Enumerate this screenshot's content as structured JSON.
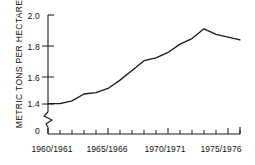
{
  "chart_data": {
    "type": "line",
    "title": "",
    "subtitle": "",
    "xlabel": "",
    "ylabel": "METRIC TONS PER HECTARE",
    "x": [
      "1960/1961",
      "1961/1962",
      "1962/1963",
      "1963/1964",
      "1964/1965",
      "1965/1966",
      "1966/1967",
      "1967/1968",
      "1968/1969",
      "1969/1970",
      "1970/1971",
      "1971/1972",
      "1972/1973",
      "1973/1974",
      "1974/1975",
      "1975/1976",
      "1976/1977"
    ],
    "values": [
      1.36,
      1.36,
      1.38,
      1.43,
      1.44,
      1.47,
      1.53,
      1.6,
      1.67,
      1.69,
      1.73,
      1.79,
      1.83,
      1.9,
      1.86,
      1.84,
      1.82
    ],
    "ylim": [
      1.3,
      2.0
    ],
    "axis_break": true,
    "grid": false,
    "legend": false,
    "y_tick_labels": [
      "2.0",
      "1.8",
      "1.6",
      "1.4",
      "0"
    ],
    "y_tick_values": [
      2.0,
      1.8,
      1.6,
      1.4,
      0
    ],
    "x_tick_labels": [
      "1960/1961",
      "1965/1966",
      "1970/1971",
      "1975/1976"
    ],
    "x_tick_positions": [
      0,
      5,
      10,
      15
    ],
    "line_color": "#1a1a1a",
    "axis_color": "#1a1a1a"
  }
}
